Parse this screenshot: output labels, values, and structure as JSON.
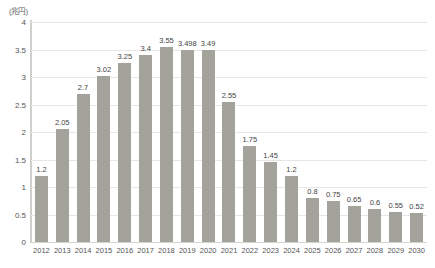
{
  "chart_data": {
    "type": "bar",
    "title": "",
    "subtitle": "",
    "xlabel": "",
    "ylabel": "",
    "unit_label": "(兆円)",
    "categories": [
      "2012",
      "2013",
      "2014",
      "2015",
      "2016",
      "2017",
      "2018",
      "2019",
      "2020",
      "2021",
      "2022",
      "2023",
      "2024",
      "2025",
      "2026",
      "2027",
      "2028",
      "2029",
      "2030"
    ],
    "values": [
      1.2,
      2.05,
      2.7,
      3.02,
      3.25,
      3.4,
      3.55,
      3.498,
      3.49,
      2.55,
      1.75,
      1.45,
      1.2,
      0.8,
      0.75,
      0.65,
      0.6,
      0.55,
      0.52
    ],
    "value_labels": [
      "1.2",
      "2.05",
      "2.7",
      "3.02",
      "3.25",
      "3.4",
      "3.55",
      "3.498",
      "3.49",
      "2.55",
      "1.75",
      "1.45",
      "1.2",
      "0.8",
      "0.75",
      "0.65",
      "0.6",
      "0.55",
      "0.52"
    ],
    "ylim": [
      0,
      4
    ],
    "yticks": [
      0,
      0.5,
      1,
      1.5,
      2,
      2.5,
      3,
      3.5,
      4
    ],
    "ytick_labels": [
      "0",
      "0.5",
      "1",
      "1.5",
      "2",
      "2.5",
      "3",
      "3.5",
      "4"
    ],
    "grid": true,
    "legend": false,
    "legend_position": "none",
    "bar_color": "#a3a39c",
    "gridline_color": "#e6e6e4",
    "axis_color": "#cfcfcc",
    "text_color": "#555555",
    "background_color": "#ffffff"
  }
}
